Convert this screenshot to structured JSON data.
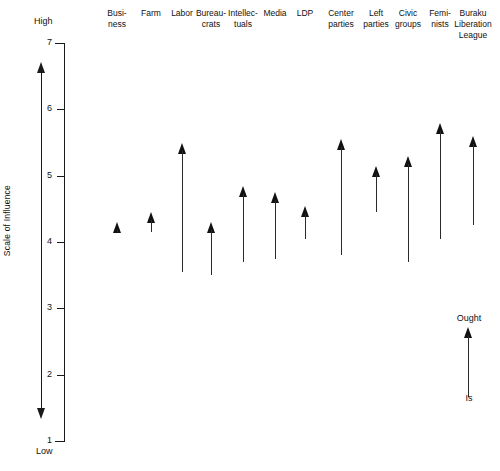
{
  "chart_data": {
    "type": "bar",
    "title": "",
    "subtitle": "",
    "xlabel": "",
    "ylabel": "Scale of Influence",
    "ylim": [
      1,
      7
    ],
    "y_axis_top_cap": "High",
    "y_axis_bottom_cap": "Low",
    "y_ticks": [
      7,
      6,
      5,
      4,
      3,
      2,
      1
    ],
    "grid": false,
    "legend_position": "bottom-right",
    "legend": {
      "top_label": "Ought",
      "bottom_label": "Is",
      "description": "Arrow runs from the 'Is' (current) value at its base up to the 'Ought' (desired) value at its tip"
    },
    "categories": [
      "Busi-\nness",
      "Farm",
      "Labor",
      "Bureau-\ncrats",
      "Intellec-\ntuals",
      "Media",
      "LDP",
      "Center\nparties",
      "Left\nparties",
      "Civic\ngroups",
      "Femi-\nnists",
      "Buraku\nLiberation\nLeague"
    ],
    "series": [
      {
        "name": "Is",
        "values": [
          4.15,
          4.15,
          3.55,
          3.5,
          3.7,
          3.75,
          4.05,
          3.8,
          4.45,
          3.7,
          4.05,
          4.25
        ]
      },
      {
        "name": "Ought",
        "values": [
          4.3,
          4.45,
          5.5,
          4.3,
          4.85,
          4.75,
          4.55,
          5.55,
          5.15,
          5.3,
          5.8,
          5.6
        ]
      }
    ],
    "colors": {
      "arrow": "#111111",
      "axis": "#1a1a1a",
      "background": "#ffffff",
      "text": "#111111"
    }
  }
}
